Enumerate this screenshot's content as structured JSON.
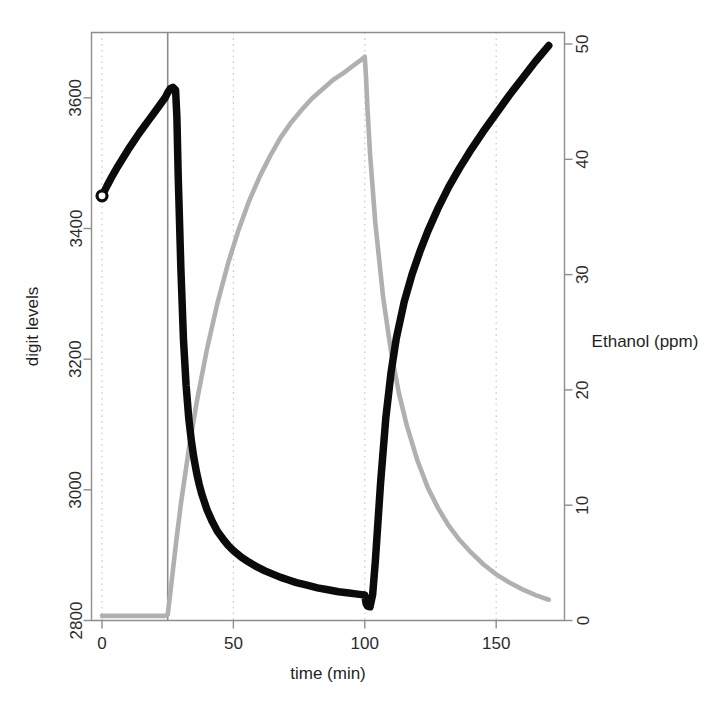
{
  "chart_data": {
    "type": "line",
    "title": "",
    "xlabel": "time (min)",
    "ylabel": "digit levels",
    "y2label": "Ethanol (ppm)",
    "xlim": [
      -4,
      176
    ],
    "ylim": [
      2800,
      3700
    ],
    "y2lim": [
      0,
      51
    ],
    "grid": true,
    "legend_position": "none",
    "xticks": [
      0,
      50,
      100,
      150
    ],
    "xticklabels": [
      "0",
      "50",
      "100",
      "150"
    ],
    "yticks": [
      2800,
      3000,
      3200,
      3400,
      3600
    ],
    "yticklabels": [
      "2800",
      "3000",
      "3200",
      "3400",
      "3600"
    ],
    "y2ticks": [
      0,
      10,
      20,
      30,
      40,
      50
    ],
    "y2ticklabels": [
      "0",
      "10",
      "20",
      "30",
      "40",
      "50"
    ],
    "annotations": [
      {
        "name": "event-line-25min",
        "type": "vline",
        "x": 25,
        "style": "solid",
        "color": "#8c8c8c"
      }
    ],
    "series": [
      {
        "name": "digit levels",
        "axis": "left",
        "color": "#0b0b0b",
        "marker": "open-circle-start",
        "x": [
          0,
          2,
          4,
          6,
          8,
          10,
          12,
          14,
          16,
          18,
          20,
          22,
          24,
          25,
          26,
          27,
          28,
          28.5,
          29,
          30,
          31,
          32,
          33,
          34,
          35,
          36,
          37,
          38,
          40,
          42,
          44,
          46,
          48,
          50,
          53,
          56,
          59,
          62,
          65,
          68,
          71,
          74,
          78,
          82,
          86,
          90,
          94,
          98,
          100,
          100.5,
          101,
          102,
          103,
          104,
          105,
          106,
          108,
          110,
          112,
          115,
          118,
          121,
          124,
          128,
          132,
          136,
          140,
          145,
          150,
          155,
          160,
          165,
          170
        ],
        "y": [
          3450,
          3466,
          3481,
          3495,
          3508,
          3521,
          3533,
          3545,
          3556,
          3567,
          3578,
          3589,
          3600,
          3608,
          3614,
          3616,
          3612,
          3570,
          3480,
          3340,
          3230,
          3160,
          3110,
          3075,
          3048,
          3026,
          3008,
          2993,
          2969,
          2951,
          2936,
          2925,
          2915,
          2907,
          2897,
          2889,
          2882,
          2876,
          2871,
          2866,
          2862,
          2858,
          2854,
          2850,
          2847,
          2844,
          2842,
          2840,
          2839,
          2826,
          2822,
          2821,
          2840,
          2890,
          2950,
          3010,
          3110,
          3180,
          3232,
          3288,
          3330,
          3365,
          3396,
          3432,
          3464,
          3492,
          3518,
          3548,
          3576,
          3604,
          3630,
          3656,
          3680
        ]
      },
      {
        "name": "Ethanol (ppm)",
        "axis": "right",
        "color": "#b0b0b0",
        "x": [
          0,
          5,
          10,
          15,
          20,
          24,
          25,
          26,
          28,
          30,
          33,
          36,
          40,
          44,
          48,
          52,
          56,
          60,
          64,
          68,
          72,
          76,
          80,
          84,
          88,
          92,
          96,
          99,
          100,
          100.5,
          101,
          102,
          104,
          107,
          110,
          113,
          116,
          120,
          124,
          128,
          132,
          136,
          140,
          145,
          150,
          155,
          160,
          165,
          170
        ],
        "y": [
          0.4,
          0.4,
          0.4,
          0.4,
          0.4,
          0.4,
          0.5,
          2.4,
          6.4,
          10.1,
          14.8,
          18.9,
          23.6,
          27.6,
          31.0,
          33.9,
          36.4,
          38.5,
          40.3,
          41.9,
          43.2,
          44.3,
          45.3,
          46.1,
          46.9,
          47.5,
          48.2,
          48.7,
          48.9,
          47.0,
          44.5,
          40.5,
          34.5,
          28.0,
          23.3,
          19.7,
          16.9,
          13.9,
          11.5,
          9.7,
          8.2,
          7.0,
          6.0,
          4.9,
          4.0,
          3.3,
          2.7,
          2.2,
          1.8
        ]
      }
    ]
  }
}
